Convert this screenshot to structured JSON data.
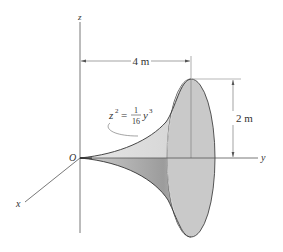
{
  "figure": {
    "axes": {
      "x_label": "x",
      "y_label": "y",
      "z_label": "z",
      "origin_label": "O"
    },
    "dimensions": {
      "length_label": "4 m",
      "height_label": "2 m"
    },
    "equation": {
      "lhs": "z",
      "lhs_exponent": "2",
      "equals": "=",
      "frac_num": "1",
      "frac_den": "16",
      "rhs_var": "y",
      "rhs_exponent": "3"
    },
    "colors": {
      "surface_light": "#d9d9d9",
      "surface_dark": "#a9a9a9",
      "end_cap": "#c8c8c8",
      "lines": "#444444"
    }
  }
}
